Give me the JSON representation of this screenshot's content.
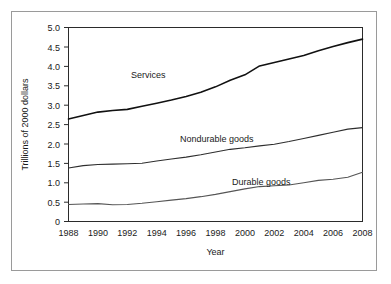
{
  "chart_data": {
    "type": "line",
    "title": "",
    "xlabel": "Year",
    "ylabel": "Trillions of 2000 dollars",
    "xlim": [
      1988,
      2008
    ],
    "ylim": [
      0,
      5.0
    ],
    "grid": false,
    "legend_position": "inline-annotations",
    "xticks": [
      1988,
      1990,
      1992,
      1994,
      1996,
      1998,
      2000,
      2002,
      2004,
      2006,
      2008
    ],
    "xtick_labels": [
      "1988",
      "1990",
      "1992",
      "1994",
      "1996",
      "1998",
      "2000",
      "2002",
      "2004",
      "2006",
      "2008"
    ],
    "yticks": [
      0,
      0.5,
      1.0,
      1.5,
      2.0,
      2.5,
      3.0,
      3.5,
      4.0,
      4.5,
      5.0
    ],
    "ytick_labels": [
      "0",
      "0.5",
      "1.0",
      "1.5",
      "2.0",
      "2.5",
      "3.0",
      "3.5",
      "4.0",
      "4.5",
      "5.0"
    ],
    "x": [
      1988,
      1989,
      1990,
      1991,
      1992,
      1993,
      1994,
      1995,
      1996,
      1997,
      1998,
      1999,
      2000,
      2001,
      2002,
      2003,
      2004,
      2005,
      2006,
      2007,
      2008
    ],
    "series": [
      {
        "name": "Services",
        "label": "Services",
        "values": [
          2.64,
          2.73,
          2.82,
          2.86,
          2.89,
          2.97,
          3.05,
          3.13,
          3.22,
          3.33,
          3.47,
          3.64,
          3.78,
          4.01,
          4.1,
          4.19,
          4.28,
          4.4,
          4.51,
          4.61,
          4.7
        ]
      },
      {
        "name": "Nondurable goods",
        "label": "Nondurable goods",
        "values": [
          1.38,
          1.44,
          1.47,
          1.48,
          1.49,
          1.5,
          1.56,
          1.61,
          1.66,
          1.72,
          1.79,
          1.86,
          1.9,
          1.95,
          1.99,
          2.06,
          2.14,
          2.22,
          2.3,
          2.38,
          2.42
        ]
      },
      {
        "name": "Durable goods",
        "label": "Durable goods",
        "values": [
          0.44,
          0.45,
          0.46,
          0.43,
          0.44,
          0.47,
          0.51,
          0.55,
          0.59,
          0.64,
          0.7,
          0.77,
          0.84,
          0.9,
          0.92,
          0.94,
          1.0,
          1.06,
          1.09,
          1.14,
          1.27
        ]
      }
    ],
    "annotations": [
      {
        "text": "Services",
        "x_px": 131,
        "y_px": 78
      },
      {
        "text": "Nondurable goods",
        "x_px": 180,
        "y_px": 142
      },
      {
        "text": "Durable goods",
        "x_px": 232,
        "y_px": 185
      }
    ]
  },
  "axes": {
    "y_title": "Trillions of 2000 dollars",
    "x_title": "Year"
  }
}
